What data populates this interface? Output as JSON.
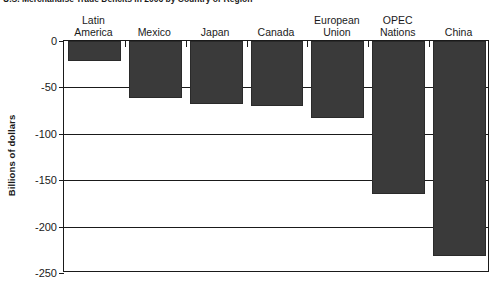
{
  "chart_data": {
    "type": "bar",
    "title": "U.S. Merchandise Trade Deficits in 2006 by Country or Region",
    "xlabel": "",
    "ylabel": "Billions of dollars",
    "ylim": [
      -250,
      0
    ],
    "yticks": [
      0,
      -50,
      -100,
      -150,
      -200,
      -250
    ],
    "ytick_labels": [
      "0",
      "-50",
      "-100",
      "-150",
      "-200",
      "-250"
    ],
    "grid": true,
    "legend": "none",
    "orientation": "vertical-negative",
    "category_label_position": "top",
    "bar_color": "#3a3a3a",
    "axis_color": "#1a1a1a",
    "categories": [
      "Latin\nAmerica",
      "Mexico",
      "Japan",
      "Canada",
      "European\nUnion",
      "OPEC\nNations",
      "China"
    ],
    "values": [
      -22,
      -61,
      -68,
      -70,
      -83,
      -165,
      -232
    ]
  }
}
